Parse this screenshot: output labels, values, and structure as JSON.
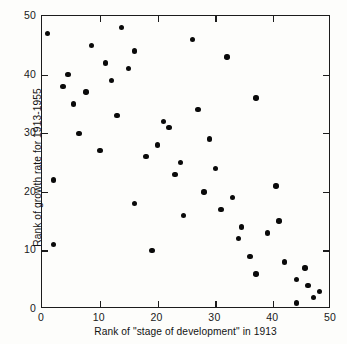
{
  "chart_data": {
    "type": "scatter",
    "title": "",
    "xlabel": "Rank of \"stage of development\" in 1913",
    "ylabel": "Rank of growth rate for 1913-1955",
    "xlim": [
      0,
      50
    ],
    "ylim": [
      0,
      50
    ],
    "xticks": [
      0,
      10,
      20,
      30,
      40,
      50
    ],
    "yticks": [
      0,
      10,
      20,
      30,
      40,
      50
    ],
    "xtick_labels": [
      "0",
      "10",
      "20",
      "30",
      "40",
      "50"
    ],
    "ytick_labels": [
      "0",
      "10",
      "20",
      "30",
      "40",
      "50"
    ],
    "grid": false,
    "legend": false,
    "marker": "filled-circle",
    "marker_color": "#0a0a0a",
    "frame_color": "#1c1c1c",
    "background_color": "#fdfdfb",
    "points": [
      {
        "x": 1,
        "y": 47
      },
      {
        "x": 2,
        "y": 22
      },
      {
        "x": 2,
        "y": 11
      },
      {
        "x": 3.6,
        "y": 38
      },
      {
        "x": 4.5,
        "y": 40
      },
      {
        "x": 5.5,
        "y": 35
      },
      {
        "x": 6.4,
        "y": 30
      },
      {
        "x": 7.6,
        "y": 37
      },
      {
        "x": 8.6,
        "y": 45
      },
      {
        "x": 10,
        "y": 27
      },
      {
        "x": 11,
        "y": 42
      },
      {
        "x": 12,
        "y": 39
      },
      {
        "x": 13,
        "y": 33
      },
      {
        "x": 13.8,
        "y": 48
      },
      {
        "x": 15,
        "y": 41
      },
      {
        "x": 16,
        "y": 44
      },
      {
        "x": 16,
        "y": 18
      },
      {
        "x": 18,
        "y": 26
      },
      {
        "x": 19,
        "y": 10
      },
      {
        "x": 20,
        "y": 28
      },
      {
        "x": 21,
        "y": 32
      },
      {
        "x": 22,
        "y": 31
      },
      {
        "x": 23,
        "y": 23
      },
      {
        "x": 24,
        "y": 25
      },
      {
        "x": 24.5,
        "y": 16
      },
      {
        "x": 26,
        "y": 46
      },
      {
        "x": 27,
        "y": 34
      },
      {
        "x": 28,
        "y": 20
      },
      {
        "x": 29,
        "y": 29
      },
      {
        "x": 30,
        "y": 24
      },
      {
        "x": 31,
        "y": 17
      },
      {
        "x": 32,
        "y": 43
      },
      {
        "x": 33,
        "y": 19
      },
      {
        "x": 34,
        "y": 12
      },
      {
        "x": 34.5,
        "y": 14
      },
      {
        "x": 36,
        "y": 9
      },
      {
        "x": 37,
        "y": 36
      },
      {
        "x": 37,
        "y": 6
      },
      {
        "x": 39,
        "y": 13
      },
      {
        "x": 40.5,
        "y": 21
      },
      {
        "x": 41,
        "y": 15
      },
      {
        "x": 42,
        "y": 8
      },
      {
        "x": 44,
        "y": 5
      },
      {
        "x": 44,
        "y": 1
      },
      {
        "x": 45.5,
        "y": 7
      },
      {
        "x": 46,
        "y": 4
      },
      {
        "x": 47,
        "y": 2
      },
      {
        "x": 48,
        "y": 3
      }
    ]
  }
}
